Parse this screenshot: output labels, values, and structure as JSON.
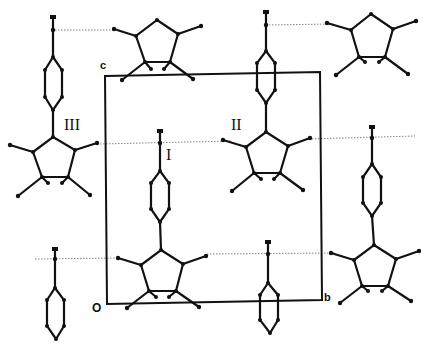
{
  "figure": {
    "colors": {
      "ink": "#111111",
      "background": "#ffffff",
      "dotted_line": "#777777"
    }
  },
  "unit_cell": {
    "origin_label": "O",
    "axis_b_label": "b",
    "axis_c_label": "c",
    "corners": {
      "top_left": [
        105,
        76
      ],
      "top_right": [
        320,
        72
      ],
      "bottom_right": [
        322,
        300
      ],
      "bottom_left": [
        107,
        304
      ]
    }
  },
  "molecule_labels": [
    {
      "id": "I",
      "text": "I"
    },
    {
      "id": "II",
      "text": "II"
    },
    {
      "id": "III",
      "text": "III"
    }
  ]
}
